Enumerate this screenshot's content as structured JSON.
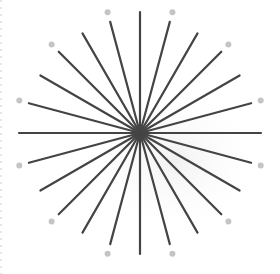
{
  "diagram": {
    "type": "radial-starburst",
    "center": [
      140,
      133
    ],
    "ray_count": 24,
    "ray_angle_step_deg": 15,
    "ray_radius_long": 121,
    "ray_radius_short": 115,
    "ray_color": "#444444",
    "ray_width": 2.2,
    "dot_count": 12,
    "dot_angle_offset_deg": 15,
    "dot_radius_distance": 125,
    "dot_size": 3,
    "dot_color": "#c4c4c4",
    "shadow_color": "#f2f2f2",
    "background": "#ffffff"
  }
}
